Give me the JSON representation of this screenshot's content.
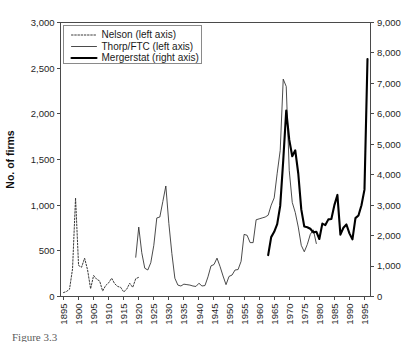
{
  "figure": {
    "caption": "Figure 3.3"
  },
  "chart_data": {
    "type": "line",
    "title": "",
    "xlabel": "",
    "ylabel": "No. of firms",
    "y2label": "",
    "xlim": [
      1894,
      1997
    ],
    "ylim": [
      0,
      3000
    ],
    "y2lim": [
      0,
      9000
    ],
    "grid": false,
    "legend_position": "top-left",
    "xticks": [
      1895,
      1900,
      1905,
      1910,
      1915,
      1920,
      1925,
      1930,
      1935,
      1940,
      1945,
      1950,
      1955,
      1960,
      1965,
      1970,
      1975,
      1980,
      1985,
      1990,
      1995
    ],
    "xticklabels": [
      "1895",
      "1900",
      "1905",
      "1910",
      "1915",
      "1920",
      "1925",
      "1930",
      "1935",
      "1940",
      "1945",
      "1950",
      "1955",
      "1960",
      "1965",
      "1970",
      "1975",
      "1980",
      "1985",
      "1990",
      "1995"
    ],
    "yticks": [
      0,
      500,
      1000,
      1500,
      2000,
      2500,
      3000
    ],
    "yticklabels": [
      "0",
      "500",
      "1,000",
      "1,500",
      "2,000",
      "2,500",
      "3,000"
    ],
    "y2ticks": [
      0,
      1000,
      2000,
      3000,
      4000,
      5000,
      6000,
      7000,
      8000,
      9000
    ],
    "y2ticklabels": [
      "0",
      "1,000",
      "2,000",
      "3,000",
      "4,000",
      "5,000",
      "6,000",
      "7,000",
      "8,000",
      "9,000"
    ],
    "series": [
      {
        "name": "Nelson (left axis)",
        "axis": "left",
        "style": "dotted",
        "x": [
          1895,
          1896,
          1897,
          1898,
          1899,
          1900,
          1901,
          1902,
          1903,
          1904,
          1905,
          1906,
          1907,
          1908,
          1909,
          1910,
          1911,
          1912,
          1913,
          1914,
          1915,
          1916,
          1917,
          1918,
          1919,
          1920
        ],
        "values": [
          43,
          55,
          80,
          303,
          1080,
          340,
          320,
          420,
          290,
          85,
          230,
          190,
          170,
          60,
          120,
          150,
          200,
          140,
          110,
          100,
          50,
          80,
          145,
          100,
          195,
          210
        ]
      },
      {
        "name": "Thorp/FTC (left axis)",
        "axis": "left",
        "style": "thin",
        "x": [
          1919,
          1920,
          1921,
          1922,
          1923,
          1924,
          1925,
          1926,
          1927,
          1928,
          1929,
          1930,
          1931,
          1932,
          1933,
          1934,
          1935,
          1936,
          1937,
          1938,
          1939,
          1940,
          1941,
          1942,
          1943,
          1944,
          1945,
          1946,
          1947,
          1948,
          1949,
          1950,
          1951,
          1952,
          1953,
          1954,
          1955,
          1956,
          1957,
          1958,
          1959,
          1960,
          1961,
          1962,
          1963,
          1964,
          1965,
          1966,
          1967,
          1968,
          1969,
          1970,
          1971,
          1972,
          1973,
          1974,
          1975,
          1976,
          1977,
          1978,
          1979
        ],
        "values": [
          430,
          760,
          480,
          310,
          290,
          370,
          560,
          860,
          870,
          1040,
          1210,
          800,
          470,
          200,
          125,
          115,
          135,
          130,
          125,
          115,
          110,
          145,
          115,
          120,
          215,
          335,
          350,
          420,
          330,
          225,
          130,
          220,
          235,
          290,
          295,
          385,
          680,
          670,
          590,
          590,
          840,
          850,
          860,
          870,
          890,
          1000,
          1080,
          1350,
          1600,
          2380,
          2300,
          1380,
          1030,
          920,
          760,
          560,
          490,
          570,
          680,
          730,
          580
        ]
      },
      {
        "name": "Mergerstat (right axis)",
        "axis": "right",
        "style": "thick",
        "x": [
          1963,
          1964,
          1965,
          1966,
          1967,
          1968,
          1969,
          1970,
          1971,
          1972,
          1973,
          1974,
          1975,
          1976,
          1977,
          1978,
          1979,
          1980,
          1981,
          1982,
          1983,
          1984,
          1985,
          1986,
          1987,
          1988,
          1989,
          1990,
          1991,
          1992,
          1993,
          1994,
          1995,
          1996
        ],
        "values": [
          1361,
          1950,
          2125,
          2377,
          2975,
          4462,
          6107,
          5152,
          4608,
          4801,
          4040,
          2861,
          2297,
          2276,
          2224,
          2106,
          2128,
          1889,
          2395,
          2346,
          2533,
          2543,
          3001,
          3336,
          2032,
          2258,
          2366,
          2074,
          1877,
          2574,
          2663,
          2997,
          3510,
          7800
        ]
      }
    ],
    "legend": [
      {
        "label": "Nelson (left axis)",
        "style": "dotted"
      },
      {
        "label": "Thorp/FTC (left axis)",
        "style": "thin"
      },
      {
        "label": "Mergerstat (right axis)",
        "style": "thick"
      }
    ]
  }
}
